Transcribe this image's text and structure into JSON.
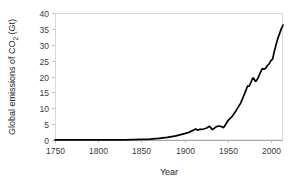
{
  "chart_data": {
    "type": "line",
    "title": "",
    "xlabel": "Year",
    "ylabel": "Global emissions of CO2 (Gt)",
    "ylabel_prefix": "Global emissions of CO",
    "ylabel_subscript": "2",
    "ylabel_suffix": " (Gt)",
    "xlim": [
      1750,
      2014
    ],
    "ylim": [
      0,
      40
    ],
    "grid": false,
    "legend": null,
    "xticks": [
      1750,
      1800,
      1850,
      1900,
      1950,
      2000
    ],
    "yticks": [
      0,
      5,
      10,
      15,
      20,
      25,
      30,
      35,
      40
    ],
    "xtick_labels": [
      "1750",
      "1800",
      "1850",
      "1900",
      "1950",
      "2000"
    ],
    "ytick_labels": [
      "0",
      "5",
      "10",
      "15",
      "20",
      "25",
      "30",
      "35",
      "40"
    ],
    "series": [
      {
        "name": "Global CO2 emissions",
        "color": "#000000",
        "x": [
          1750,
          1760,
          1770,
          1780,
          1790,
          1800,
          1810,
          1820,
          1830,
          1840,
          1850,
          1860,
          1870,
          1880,
          1890,
          1900,
          1905,
          1910,
          1913,
          1915,
          1918,
          1920,
          1925,
          1929,
          1932,
          1935,
          1937,
          1940,
          1943,
          1945,
          1947,
          1950,
          1955,
          1960,
          1965,
          1970,
          1973,
          1975,
          1979,
          1980,
          1982,
          1983,
          1985,
          1988,
          1990,
          1992,
          1994,
          1996,
          1998,
          2000,
          2002,
          2004,
          2006,
          2008,
          2010,
          2012,
          2014
        ],
        "values": [
          0.01,
          0.01,
          0.01,
          0.02,
          0.03,
          0.03,
          0.05,
          0.05,
          0.07,
          0.11,
          0.2,
          0.3,
          0.5,
          0.8,
          1.3,
          2.0,
          2.4,
          3.1,
          3.5,
          3.1,
          3.4,
          3.3,
          3.7,
          4.3,
          3.3,
          3.8,
          4.2,
          4.4,
          4.2,
          3.9,
          4.6,
          6.0,
          7.4,
          9.4,
          11.6,
          14.9,
          17.0,
          17.0,
          19.5,
          19.5,
          18.5,
          18.6,
          19.5,
          21.4,
          22.5,
          22.3,
          22.6,
          23.5,
          24.0,
          25.0,
          25.5,
          28.0,
          30.0,
          32.0,
          33.5,
          35.0,
          36.2
        ]
      }
    ]
  },
  "plot_geometry": {
    "left": 55,
    "right": 283,
    "top": 13,
    "bottom": 140
  }
}
